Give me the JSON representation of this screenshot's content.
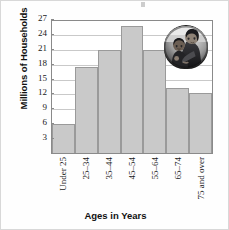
{
  "chart_data": {
    "type": "bar",
    "title": "",
    "subtitle": "",
    "xlabel": "Ages in Years",
    "ylabel": "Millions of Households",
    "categories": [
      "Under 25",
      "25–34",
      "35–44",
      "45–54",
      "55–64",
      "65–74",
      "75 and over"
    ],
    "values": [
      5.8,
      17.4,
      20.7,
      25.5,
      20.7,
      13.1,
      12.0
    ],
    "ylim": [
      0,
      27
    ],
    "yticks": [
      3,
      6,
      9,
      12,
      15,
      18,
      21,
      24,
      27
    ],
    "ytick_labels": [
      "3",
      "6",
      "9",
      "12",
      "15",
      "18",
      "21",
      "24",
      "27"
    ],
    "grid": true,
    "grid_axis": "y",
    "legend": false,
    "bar_style": "contiguous-histogram",
    "bar_fill": "#c9c9c9",
    "bar_edge": "#9a9a9a",
    "grid_color": "#c9c9c9",
    "frame_color": "#8a8a8a"
  },
  "inset": {
    "name": "photo-woman-holding-child",
    "description": "grayscale photograph of a woman holding a young child",
    "shape": "oval"
  }
}
